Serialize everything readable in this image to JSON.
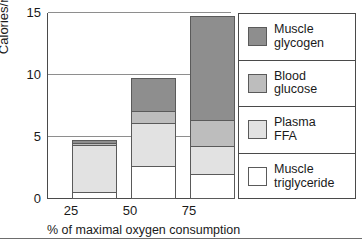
{
  "chart_data": {
    "type": "bar",
    "subtype": "stacked-vertical",
    "title": "",
    "xlabel": "% of  maximal oxygen consumption",
    "ylabel": "Calories/min",
    "categories": [
      "25",
      "50",
      "75"
    ],
    "ylim": [
      0,
      15
    ],
    "yticks": [
      0,
      5,
      10,
      15
    ],
    "ytick_labels": [
      "0",
      "5",
      "10",
      "15"
    ],
    "grid": true,
    "grid_axis": "y",
    "legend_position": "right",
    "totals": [
      5.0,
      10.0,
      15.0
    ],
    "series": [
      {
        "name": "Muscle glycogen",
        "color": "#8e8e8e",
        "values": [
          0.3,
          2.7,
          8.45
        ]
      },
      {
        "name": "Blood glucose",
        "color": "#bdbdbd",
        "values": [
          0.25,
          1.1,
          2.2
        ]
      },
      {
        "name": "Plasma FFA",
        "color": "#e2e2e2",
        "values": [
          3.9,
          3.55,
          2.35
        ]
      },
      {
        "name": "Muscle triglyceride",
        "color": "#ffffff",
        "values": [
          0.55,
          2.65,
          2.0
        ]
      }
    ]
  },
  "axes": {
    "y_title": "Calories/min",
    "y_tick_labels": [
      "15",
      "10",
      "5",
      "0"
    ],
    "x_tick_labels": [
      "25",
      "50",
      "75"
    ],
    "x_title": "% of  maximal oxygen consumption"
  },
  "legend": {
    "items": [
      {
        "label_line1": "Muscle",
        "label_line2": "glycogen",
        "color": "#8e8e8e"
      },
      {
        "label_line1": "Blood",
        "label_line2": "glucose",
        "color": "#bdbdbd"
      },
      {
        "label_line1": "Plasma",
        "label_line2": "FFA",
        "color": "#e2e2e2"
      },
      {
        "label_line1": "Muscle",
        "label_line2": "triglyceride",
        "color": "#ffffff"
      }
    ]
  },
  "colors": {
    "axis": "#4a4a4a",
    "grid": "#8e8e8e",
    "segment_border": "#5a5a5a",
    "text": "#1a1a1a",
    "background": "#ffffff"
  }
}
